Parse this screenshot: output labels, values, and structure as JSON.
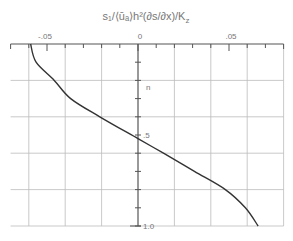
{
  "chart_data": {
    "type": "line",
    "title_display": "s₁/⟨ūₐ⟩h²(∂s/∂x)/K",
    "title_sub": "z",
    "xlabel": "s₁/⟨ūₐ⟩h² (∂s/∂x)/K_z",
    "ylabel": "n",
    "xlim": [
      -0.07,
      0.08
    ],
    "ylim": [
      1.0,
      0.0
    ],
    "y_inverted": true,
    "x_axis_position": "top",
    "grid": true,
    "x_tick_labels": [
      {
        "value": -0.05,
        "label": "-.05"
      },
      {
        "value": 0,
        "label": "0"
      },
      {
        "value": 0.05,
        "label": ".05"
      }
    ],
    "y_tick_labels": [
      {
        "value": 0.5,
        "label": ".5"
      },
      {
        "value": 1.0,
        "label": "1.0"
      }
    ],
    "series": [
      {
        "name": "profile",
        "x": [
          -0.059,
          -0.056,
          -0.046,
          -0.037,
          -0.021,
          0.0,
          0.014,
          0.031,
          0.048,
          0.059,
          0.066
        ],
        "y": [
          0.0,
          0.1,
          0.2,
          0.3,
          0.4,
          0.52,
          0.6,
          0.7,
          0.8,
          0.9,
          1.0
        ]
      }
    ]
  }
}
